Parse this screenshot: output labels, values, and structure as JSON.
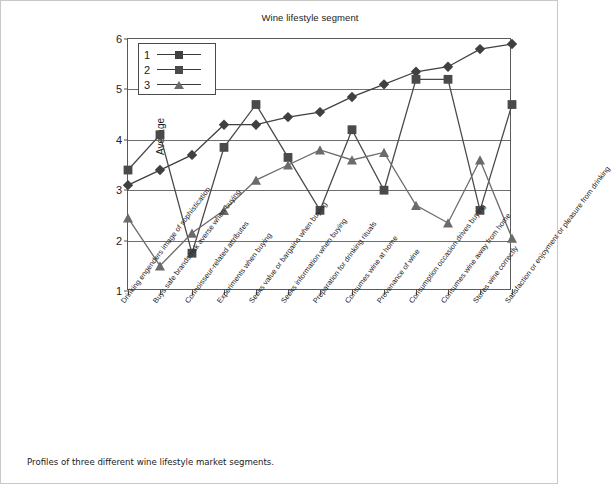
{
  "figure": {
    "caption": "Profiles of three different wine lifestyle market segments."
  },
  "chart_data": {
    "type": "line",
    "title": "Wine lifestyle segment",
    "xlabel": "",
    "ylabel": "Average",
    "ylim": [
      1,
      6
    ],
    "yticks": [
      1,
      2,
      3,
      4,
      5,
      6
    ],
    "grid": true,
    "legend_position": "top-left",
    "categories": [
      "Drinking engenders image of sophistication",
      "Buys safe brands/risk averse when buying",
      "Connoisseur-related attributes",
      "Experiments when buying",
      "Seeks value or bargains when buying",
      "Seeks information when buying",
      "Preparation for drinking rituals",
      "Consumes wine at home",
      "Provenance of wine",
      "Consumption occasion drives buying",
      "Consumes wine away from home",
      "Stores wine correctly",
      "Satisfaction or enjoyment or pleasure from drinking"
    ],
    "series": [
      {
        "name": "1",
        "marker": "diamond",
        "color": "#404040",
        "values": [
          3.1,
          3.4,
          3.7,
          4.3,
          4.3,
          4.45,
          4.55,
          4.85,
          5.1,
          5.35,
          5.45,
          5.8,
          5.9
        ]
      },
      {
        "name": "2",
        "marker": "square",
        "color": "#4a4a4a",
        "values": [
          3.4,
          4.1,
          1.75,
          3.85,
          4.7,
          3.65,
          2.6,
          4.2,
          3.0,
          5.2,
          5.2,
          2.6,
          4.7
        ]
      },
      {
        "name": "3",
        "marker": "triangle",
        "color": "#6b6b6b",
        "values": [
          2.45,
          1.5,
          2.15,
          2.6,
          3.2,
          3.5,
          3.8,
          3.6,
          3.75,
          2.7,
          2.35,
          3.6,
          2.05
        ]
      }
    ]
  },
  "legend": {
    "entries": [
      {
        "key": "1"
      },
      {
        "key": "2"
      },
      {
        "key": "3"
      }
    ]
  },
  "colors": {
    "series1": "#404040",
    "series2": "#4a4a4a",
    "series3": "#6b6b6b",
    "axis": "#5a5a5a",
    "grid": "#6e6e6e"
  }
}
